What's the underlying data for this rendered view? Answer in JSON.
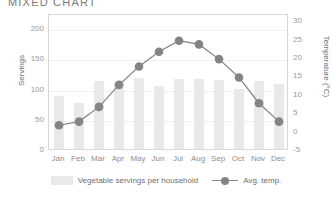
{
  "chart_data": {
    "type": "bar",
    "title": "MIXED CHART",
    "categories": [
      "Jan",
      "Feb",
      "Mar",
      "Apr",
      "May",
      "Jun",
      "Jul",
      "Aug",
      "Sep",
      "Oct",
      "Nov",
      "Dec"
    ],
    "series": [
      {
        "name": "Vegetable servings per household",
        "type": "bar",
        "axis": "left",
        "color": "#e9e9e9",
        "values": [
          87,
          76,
          113,
          113,
          118,
          105,
          116,
          116,
          114,
          100,
          112,
          108
        ]
      },
      {
        "name": "Avg. temp.",
        "type": "line",
        "axis": "right",
        "color": "#848484",
        "values": [
          2,
          3,
          7,
          13,
          18,
          22,
          25,
          24,
          20,
          15,
          8,
          3
        ]
      }
    ],
    "xlabel": "",
    "ylabel": "Servings",
    "ylabel_right": "Temperature (°C)",
    "ylim": [
      0,
      225
    ],
    "ylim_right": [
      -5,
      32
    ],
    "yticks": [
      0,
      50,
      100,
      150,
      200
    ],
    "yticks_right": [
      -5,
      0,
      5,
      10,
      15,
      20,
      25,
      30
    ],
    "grid": true,
    "legend_position": "bottom"
  },
  "legend": {
    "bars_label": "Vegetable servings per household",
    "line_label": "Avg. temp."
  }
}
